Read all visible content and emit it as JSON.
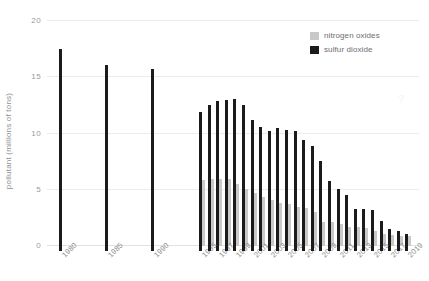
{
  "chart_data": {
    "type": "bar",
    "title": "",
    "xlabel": "",
    "ylabel": "pollutant (millions of tons)",
    "ylim": [
      0,
      20
    ],
    "yticks": [
      0,
      5,
      10,
      15,
      20
    ],
    "grid": true,
    "legend_position": "top-right",
    "categories": [
      "1980",
      "1985",
      "1990",
      "1995",
      "1996",
      "1997",
      "1998",
      "1999",
      "2000",
      "2001",
      "2002",
      "2003",
      "2004",
      "2005",
      "2006",
      "2007",
      "2008",
      "2009",
      "2010",
      "2011",
      "2012",
      "2013",
      "2014",
      "2015",
      "2016",
      "2017",
      "2018",
      "2019"
    ],
    "tick_labels": [
      "1980",
      "1985",
      "1990",
      "1995",
      "",
      "1997",
      "",
      "1999",
      "",
      "2001",
      "",
      "2003",
      "",
      "2005",
      "",
      "2007",
      "",
      "2009",
      "",
      "2011",
      "",
      "2013",
      "",
      "2015",
      "",
      "2017",
      "",
      "2019"
    ],
    "series": [
      {
        "name": "sulfur dioxide",
        "color": "#1b1b1b",
        "values": [
          17.5,
          16.1,
          15.7,
          11.9,
          12.5,
          12.9,
          13.0,
          13.1,
          12.5,
          11.2,
          10.6,
          10.2,
          10.5,
          10.3,
          10.2,
          9.4,
          8.9,
          7.6,
          5.8,
          5.1,
          4.5,
          3.3,
          3.3,
          3.2,
          2.2,
          1.5,
          1.3,
          1.1
        ],
        "note": "1980-1990 are 5-year interval points; 1995-2019 annual"
      },
      {
        "name": "nitrogen oxides",
        "color": "#c9c9c9",
        "values": [
          null,
          null,
          null,
          5.9,
          6.0,
          6.0,
          6.0,
          5.5,
          5.1,
          4.7,
          4.4,
          4.1,
          3.8,
          3.7,
          3.5,
          3.4,
          3.0,
          2.1,
          2.1,
          2.0,
          1.7,
          1.7,
          1.6,
          1.3,
          1.1,
          1.0,
          0.9,
          0.85
        ],
        "note": "no nitrogen oxides data before 1995"
      }
    ]
  },
  "legend": {
    "items": [
      {
        "label": "nitrogen oxides",
        "color": "#c9c9c9"
      },
      {
        "label": "sulfur dioxide",
        "color": "#1b1b1b"
      }
    ]
  },
  "axes": {
    "y_label": "pollutant (millions of tons)",
    "y_tick_labels": [
      "20",
      "15",
      "10",
      "5",
      "0"
    ]
  },
  "watermark": "?"
}
